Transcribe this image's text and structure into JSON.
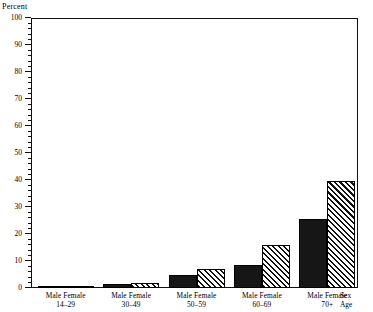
{
  "chart_data": {
    "type": "bar",
    "title": "",
    "subtitle": "",
    "xlabel": "",
    "ylabel": "Percent",
    "ylim": [
      0,
      100
    ],
    "ytick_step": 10,
    "yticks": [
      0,
      10,
      20,
      30,
      40,
      50,
      60,
      70,
      80,
      90,
      100
    ],
    "ytick_labels": [
      "0",
      "10",
      "20",
      "30",
      "40",
      "50",
      "60",
      "70",
      "80",
      "90",
      "100"
    ],
    "minor_tick_step": 2,
    "grid": false,
    "legend_position": "none",
    "categories": [
      "14–29",
      "30–49",
      "50–59",
      "60–69",
      "70+"
    ],
    "group_sex_label": "Male Female",
    "axis_name_sex": "Sex",
    "axis_name_age": "Age",
    "series": [
      {
        "name": "Male",
        "pattern": "solid",
        "color": "#161616",
        "values": [
          0.5,
          1.5,
          5.0,
          8.5,
          25.5
        ]
      },
      {
        "name": "Female",
        "pattern": "diagonal-hatch",
        "color": "#111111",
        "values": [
          0.5,
          2.0,
          7.0,
          16.0,
          39.5
        ]
      }
    ]
  },
  "axis": {
    "percent_label": "Percent"
  }
}
